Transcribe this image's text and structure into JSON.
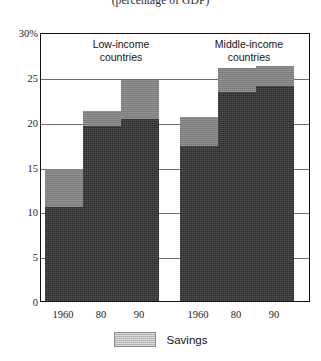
{
  "chart_data": {
    "type": "bar",
    "title": "(percentage of GDP)",
    "subtitle": "",
    "xlabel": "",
    "ylabel": "",
    "ylim": [
      0,
      30
    ],
    "grid": true,
    "stacked": true,
    "legend_position": "bottom",
    "ytick_labels": [
      "0",
      "5",
      "10",
      "15",
      "20",
      "25",
      "30%"
    ],
    "ytick_values": [
      0,
      5,
      10,
      15,
      20,
      25,
      30
    ],
    "categories": [
      "1960",
      "80",
      "90",
      "1960",
      "80",
      "90"
    ],
    "groups": [
      {
        "name": "Low-income\ncountries",
        "label_line1": "Low-income",
        "label_line2": "countries",
        "categories": [
          "1960",
          "80",
          "90"
        ],
        "totals": [
          14.7,
          21.2,
          24.7
        ],
        "base_values": [
          10.5,
          19.5,
          20.3
        ],
        "savings_values": [
          4.2,
          1.7,
          4.4
        ]
      },
      {
        "name": "Middle-income\ncountries",
        "label_line1": "Middle-income",
        "label_line2": "countries",
        "categories": [
          "1960",
          "80",
          "90"
        ],
        "totals": [
          20.5,
          26.0,
          26.2
        ],
        "base_values": [
          17.3,
          23.3,
          24.0
        ],
        "savings_values": [
          3.2,
          2.7,
          2.2
        ]
      }
    ],
    "series": [
      {
        "name": "Investment",
        "values": [
          10.5,
          19.5,
          20.3,
          17.3,
          23.3,
          24.0
        ],
        "color": "#2b2b2b"
      },
      {
        "name": "Savings",
        "values": [
          4.2,
          1.7,
          4.4,
          3.2,
          2.7,
          2.2
        ],
        "color": "#7f7f7f"
      }
    ],
    "legend": [
      {
        "label": "Savings",
        "color": "#b9b9b9"
      }
    ]
  },
  "colors": {
    "base_fill": "#2b2b2b",
    "savings_fill": "#7f7f7f",
    "legend_fill": "#b9b9b9",
    "frame": "#111111",
    "gridline": "#6e6e6e",
    "background": "#ffffff"
  }
}
